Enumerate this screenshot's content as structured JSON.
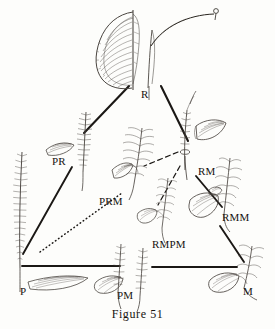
{
  "figure": {
    "caption": "Figure 51",
    "vertices": [
      {
        "code": "R",
        "label": "R",
        "role": "apex-top",
        "x": 141,
        "y": 95,
        "form": "simple entire blade with pinnate venation"
      },
      {
        "code": "P",
        "label": "P",
        "role": "vertex-bottom-left",
        "x": 20,
        "y": 292,
        "form": "tall finely pinnate frond"
      },
      {
        "code": "M",
        "label": "M",
        "role": "vertex-bottom-right",
        "x": 243,
        "y": 292,
        "form": "compound lobed frond"
      }
    ],
    "intermediates": [
      {
        "code": "PR",
        "label": "PR",
        "x": 60,
        "y": 162
      },
      {
        "code": "PRM",
        "label": "PRM",
        "x": 108,
        "y": 202
      },
      {
        "code": "RM",
        "label": "RM",
        "x": 200,
        "y": 173
      },
      {
        "code": "RMM",
        "label": "RMM",
        "x": 225,
        "y": 218
      },
      {
        "code": "RMPM",
        "label": "RMPM",
        "x": 158,
        "y": 245
      },
      {
        "code": "PM",
        "label": "PM",
        "x": 118,
        "y": 295
      }
    ],
    "connections": [
      {
        "from": "R",
        "to": "PR",
        "style": "solid"
      },
      {
        "from": "R",
        "to": "RM",
        "style": "solid"
      },
      {
        "from": "P",
        "to": "PR",
        "style": "solid"
      },
      {
        "from": "P",
        "to": "PRM",
        "style": "dotted"
      },
      {
        "from": "P",
        "to": "PM",
        "style": "solid"
      },
      {
        "from": "PM",
        "to": "M",
        "style": "solid"
      },
      {
        "from": "RM",
        "to": "PRM",
        "style": "dashed"
      },
      {
        "from": "RM",
        "to": "RMPM",
        "style": "dashed"
      },
      {
        "from": "RM",
        "to": "RMM",
        "style": "solid"
      },
      {
        "from": "RMM",
        "to": "M",
        "style": "solid"
      }
    ],
    "colors": {
      "line": "#1b1815",
      "ink": "#4a4540",
      "background": "#fdfdfb",
      "text": "#16130f"
    }
  }
}
